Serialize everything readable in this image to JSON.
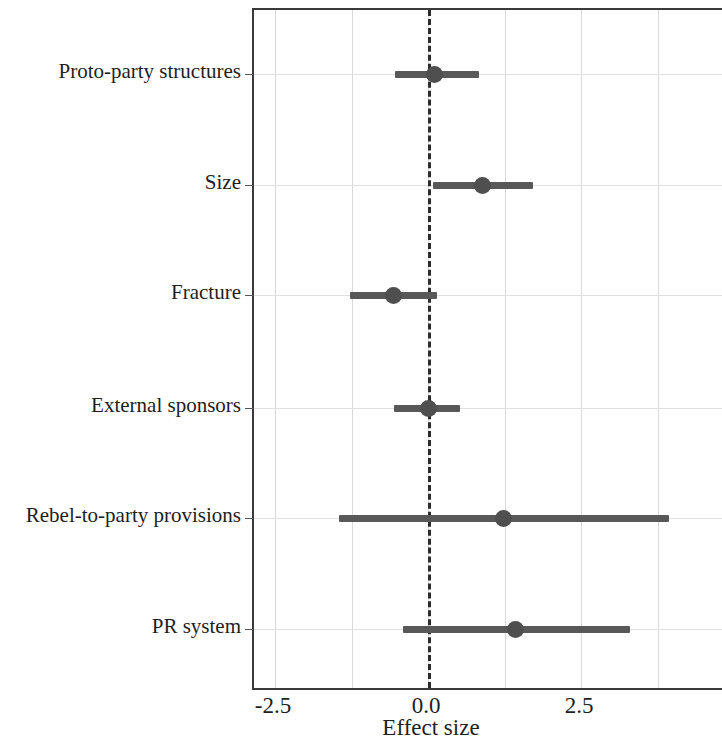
{
  "chart_data": {
    "type": "scatter",
    "subtype": "forest-plot",
    "title": "",
    "xlabel": "Effect size",
    "ylabel": "",
    "xlim": [
      -2.9,
      4.8
    ],
    "xticks": [
      -2.5,
      0.0,
      2.5
    ],
    "xticklabels": [
      "-2.5",
      "0.0",
      "2.5"
    ],
    "gridlines_x": [
      -2.5,
      -1.25,
      0.0,
      1.25,
      2.5,
      3.75
    ],
    "grid": true,
    "legend": "none",
    "reference_line": {
      "value": 0.0,
      "style": "dashed",
      "color": "#2b2b2b"
    },
    "categories": [
      "Proto-party structures",
      "Size",
      "Fracture",
      "External sponsors",
      "Rebel-to-party provisions",
      "PR system"
    ],
    "point_estimates": [
      0.1,
      0.88,
      -0.57,
      0.0,
      1.23,
      1.42
    ],
    "ci_low": [
      -0.54,
      0.08,
      -1.27,
      -0.56,
      -1.45,
      -0.41
    ],
    "ci_high": [
      0.83,
      1.72,
      0.15,
      0.52,
      3.94,
      3.3
    ],
    "marker_color": "#4f4f4f",
    "bar_color": "#585858",
    "points": [
      {
        "label": "Proto-party structures",
        "estimate": 0.1,
        "ci_low": -0.54,
        "ci_high": 0.83
      },
      {
        "label": "Size",
        "estimate": 0.88,
        "ci_low": 0.08,
        "ci_high": 1.72
      },
      {
        "label": "Fracture",
        "estimate": -0.57,
        "ci_low": -1.27,
        "ci_high": 0.15
      },
      {
        "label": "External sponsors",
        "estimate": 0.0,
        "ci_low": -0.56,
        "ci_high": 0.52
      },
      {
        "label": "Rebel-to-party provisions",
        "estimate": 1.23,
        "ci_low": -1.45,
        "ci_high": 3.94
      },
      {
        "label": "PR system",
        "estimate": 1.42,
        "ci_low": -0.41,
        "ci_high": 3.3
      }
    ]
  },
  "axis": {
    "x_title": "Effect size",
    "x_tick_labels": [
      "-2.5",
      "0.0",
      "2.5"
    ]
  }
}
